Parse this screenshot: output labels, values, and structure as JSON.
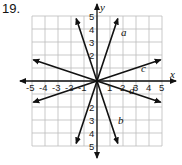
{
  "problem_number": "19.",
  "axes": {
    "x_label": "x",
    "y_label": "y",
    "x_ticks": [
      "-5",
      "-4",
      "-3",
      "-2",
      "-1",
      "1",
      "2",
      "3",
      "4",
      "5"
    ],
    "y_ticks": [
      "5",
      "4",
      "3",
      "2",
      "1",
      "-1",
      "-2",
      "-3",
      "-4",
      "-5"
    ],
    "range": [
      -5,
      5
    ]
  },
  "lines": [
    {
      "label": "a",
      "slope": 3
    },
    {
      "label": "b",
      "slope": -3
    },
    {
      "label": "c",
      "slope": 0.3333
    },
    {
      "label": "d",
      "slope": -0.3333
    }
  ],
  "colors": {
    "grid": "#bbbbbb",
    "line": "#111111"
  }
}
